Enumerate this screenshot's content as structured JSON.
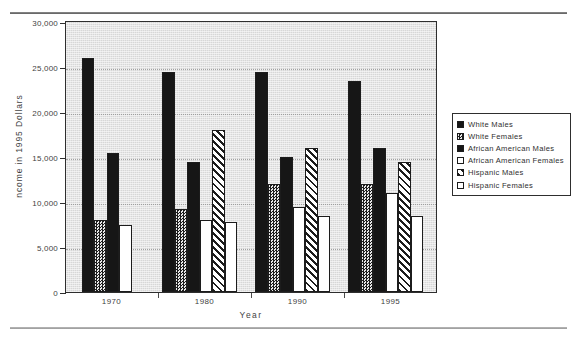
{
  "figure": {
    "ylabel": "ncome in 1995 Dollars",
    "xlabel": "Year"
  },
  "chart_data": {
    "type": "bar",
    "title": "",
    "xlabel": "Year",
    "ylabel": "Income in 1995 Dollars",
    "categories": [
      "1970",
      "1980",
      "1990",
      "1995"
    ],
    "ylim": [
      0,
      30000
    ],
    "yticks": [
      "0",
      "5,000",
      "10,000",
      "15,000",
      "20,000",
      "25,000",
      "30,000"
    ],
    "ytick_values": [
      0,
      5000,
      10000,
      15000,
      20000,
      25000,
      30000
    ],
    "grid": true,
    "legend_position": "right-outside",
    "series": [
      {
        "name": "White Males",
        "pattern": "solid-black",
        "values": [
          26000,
          24500,
          24500,
          23500
        ]
      },
      {
        "name": "White Females",
        "pattern": "checkered",
        "values": [
          8000,
          9200,
          12000,
          12000
        ]
      },
      {
        "name": "African American Males",
        "pattern": "solid-black",
        "values": [
          15500,
          14500,
          15000,
          16000
        ]
      },
      {
        "name": "African American Females",
        "pattern": "white",
        "values": [
          7500,
          8000,
          9500,
          11000
        ]
      },
      {
        "name": "Hispanic Males",
        "pattern": "diagonal",
        "values": [
          null,
          18000,
          16000,
          14500
        ]
      },
      {
        "name": "Hispanic Females",
        "pattern": "white",
        "values": [
          null,
          7800,
          8400,
          8400
        ]
      }
    ]
  },
  "legend": {
    "items": [
      {
        "label": "White  Males",
        "pattern": "solid-black"
      },
      {
        "label": "White  Females",
        "pattern": "checkered"
      },
      {
        "label": "African  American  Males",
        "pattern": "solid-black"
      },
      {
        "label": "African  American  Females",
        "pattern": "white"
      },
      {
        "label": "Hispanic  Males",
        "pattern": "diagonal"
      },
      {
        "label": "Hispanic  Females",
        "pattern": "white"
      }
    ]
  },
  "colors": {
    "plot_background": "#d7d7d7",
    "axis": "#2e2e2e",
    "bar_dark": "#161616",
    "bar_light": "#ffffff",
    "text": "#3f3f3f"
  }
}
